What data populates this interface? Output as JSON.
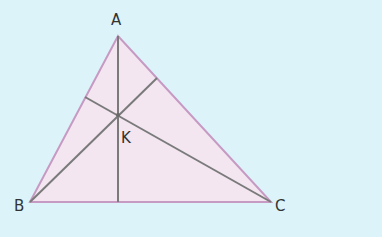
{
  "diagram": {
    "background": "#dcf3f9",
    "triangle_fill": "#f3e6f1",
    "triangle_stroke": "#c79ac4",
    "line_color": "#7a7a7a",
    "labels": {
      "A": "A",
      "B": "B",
      "C": "C",
      "K": "K"
    },
    "vertices": {
      "A": [
        118,
        36
      ],
      "B": [
        30,
        202
      ],
      "C": [
        271,
        202
      ]
    },
    "intersection_K": [
      118,
      115
    ],
    "cevians": [
      {
        "from": "A",
        "to_point": [
          118,
          202
        ]
      },
      {
        "from": "B",
        "to_point": [
          157,
          78
        ]
      },
      {
        "from": "C",
        "to_point": [
          85,
          97
        ]
      }
    ]
  }
}
